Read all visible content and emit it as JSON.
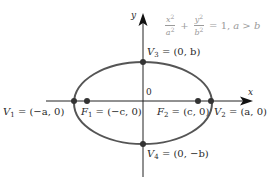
{
  "diagram": {
    "type": "ellipse",
    "equation": {
      "x_num": "x",
      "x_den": "a",
      "y_num": "y",
      "y_den": "b",
      "exp": "2",
      "plus": "+",
      "rhs": "= 1,",
      "condition": "a > b"
    },
    "axes": {
      "x_label": "x",
      "y_label": "y",
      "origin_label": "0"
    },
    "points": {
      "V1": {
        "name": "V",
        "sub": "1",
        "coords": "= (−a, 0)"
      },
      "V2": {
        "name": "V",
        "sub": "2",
        "coords": "= (a, 0)"
      },
      "V3": {
        "name": "V",
        "sub": "3",
        "coords": "= (0, b)"
      },
      "V4": {
        "name": "V",
        "sub": "4",
        "coords": "= (0, −b)"
      },
      "F1": {
        "name": "F",
        "sub": "1",
        "coords": "= (−c, 0)"
      },
      "F2": {
        "name": "F",
        "sub": "2",
        "coords": "= (c, 0)"
      }
    },
    "colors": {
      "ellipse": "#555555",
      "axis": "#222222",
      "point": "#333333",
      "equation_text": "#9a9a9a"
    }
  }
}
